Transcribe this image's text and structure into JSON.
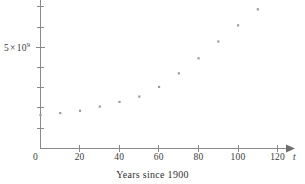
{
  "figure": {
    "caption": "Years since 1900",
    "x_axis_variable": "t",
    "origin_label": "0",
    "y_axis_label": {
      "coefficient": "5",
      "times": "×",
      "base": "10",
      "exponent": "9",
      "full": "5 × 10⁹"
    },
    "x_tick_labels": [
      "20",
      "40",
      "60",
      "80",
      "100",
      "120"
    ],
    "colors": {
      "axis": "#8a8a8a",
      "point": "#9a9aa2",
      "text": "#3a3a3a",
      "background": "#ffffff"
    }
  },
  "chart_data": {
    "type": "scatter",
    "title": "",
    "xlabel": "Years since 1900",
    "ylabel": "",
    "xlim": [
      0,
      135
    ],
    "ylim": [
      0,
      7500000000
    ],
    "grid": false,
    "legend": null,
    "x_ticks": [
      0,
      20,
      40,
      60,
      80,
      100,
      120
    ],
    "x_tick_labels": [
      "0",
      "20",
      "40",
      "60",
      "80",
      "100",
      "120"
    ],
    "y_ticks": [
      1000000000,
      2000000000,
      3000000000,
      4000000000,
      5000000000,
      6000000000,
      7000000000
    ],
    "y_tick_labels": [
      "",
      "",
      "",
      "",
      "5 × 10⁹",
      "",
      ""
    ],
    "series": [
      {
        "name": "World population",
        "x": [
          0,
          10,
          20,
          30,
          40,
          50,
          60,
          70,
          80,
          90,
          100,
          110
        ],
        "y": [
          1650000000,
          1750000000,
          1860000000,
          2070000000,
          2300000000,
          2560000000,
          3040000000,
          3710000000,
          4450000000,
          5280000000,
          6080000000,
          6870000000
        ]
      }
    ]
  }
}
